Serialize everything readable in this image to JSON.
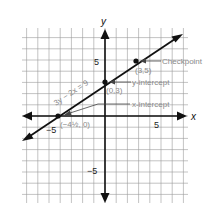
{
  "chart_data": {
    "type": "line",
    "title": "",
    "xlabel": "x",
    "ylabel": "y",
    "xlim": [
      -7.4,
      7.4
    ],
    "ylim": [
      -7.7,
      7.8
    ],
    "grid": true,
    "x_ticks": [
      {
        "value": -5,
        "label": "−5"
      },
      {
        "value": 5,
        "label": "5"
      }
    ],
    "y_ticks": [
      {
        "value": 5,
        "label": "5"
      },
      {
        "value": -5,
        "label": "−5"
      }
    ],
    "line": {
      "equation": "3y − 2x = 9",
      "slope": 0.6667,
      "intercept": 3,
      "x_from": -7.4,
      "x_to": 6.5
    },
    "points": [
      {
        "x": -4.5,
        "y": 0,
        "label": "(−4½, 0)",
        "annotation": "x-intercept"
      },
      {
        "x": 0,
        "y": 3,
        "label": "(0,3)",
        "annotation": "y-intercept"
      },
      {
        "x": 3,
        "y": 5,
        "label": "(3,5)",
        "annotation": "Checkpoint"
      }
    ]
  },
  "labels": {
    "x_axis": "x",
    "y_axis": "y",
    "tick_x_neg5": "−5",
    "tick_x_pos5": "5",
    "tick_y_pos5": "5",
    "tick_y_neg5": "−5",
    "equation": "3y − 2x = 9",
    "checkpoint": "Checkpoint",
    "checkpoint_coord": "(3,5)",
    "y_intercept": "y-intercept",
    "y_intercept_coord": "(0,3)",
    "x_intercept": "x-intercept",
    "x_intercept_coord": "(−4½, 0)"
  },
  "colors": {
    "grid": "#9a9a9a",
    "axis": "#111111",
    "line": "#111111",
    "annotation": "#8a8a8a"
  }
}
